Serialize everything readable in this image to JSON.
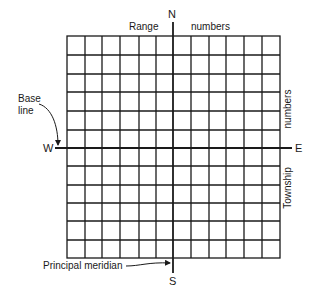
{
  "diagram": {
    "type": "rectangular-survey-system-grid",
    "grid": {
      "columns": 12,
      "rows": 12,
      "columns_west_of_meridian": 6,
      "columns_east_of_meridian": 6,
      "rows_north_of_baseline": 6,
      "rows_south_of_baseline": 6
    },
    "colors": {
      "line": "#1a1a1a",
      "background": "#ffffff"
    },
    "compass": {
      "north": "N",
      "south": "S",
      "west": "W",
      "east": "E"
    },
    "labels": {
      "range_word": "Range",
      "range_numbers": "numbers",
      "township_numbers": "numbers",
      "township_word": "Township",
      "base_line_1": "Base",
      "base_line_2": "line",
      "principal_meridian": "Principal meridian"
    }
  }
}
